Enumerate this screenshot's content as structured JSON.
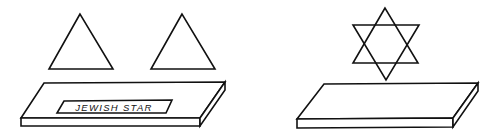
{
  "figure": {
    "left_panel": {
      "description": "two separate triangles above a platform",
      "label_plate_text": "JEWISH STAR",
      "shapes": [
        "triangle",
        "triangle",
        "platform"
      ]
    },
    "right_panel": {
      "description": "two triangles combined into a six-pointed star above a platform",
      "shapes": [
        "six-pointed-star",
        "platform"
      ]
    },
    "colors": {
      "line": "#111111",
      "background": "#ffffff"
    }
  }
}
